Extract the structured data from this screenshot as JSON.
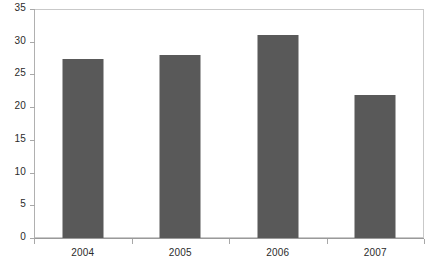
{
  "chart_data": {
    "type": "bar",
    "title": "",
    "xlabel": "",
    "ylabel": "",
    "categories": [
      "2004",
      "2005",
      "2006",
      "2007"
    ],
    "values": [
      27.3,
      28.0,
      31.0,
      21.8
    ],
    "series": [
      {
        "name": "",
        "values": [
          27.3,
          28.0,
          31.0,
          21.8
        ]
      }
    ],
    "ylim": [
      0,
      35
    ],
    "ytick_step": 5,
    "ytick_labels": [
      "0",
      "5",
      "10",
      "15",
      "20",
      "25",
      "30",
      "35"
    ],
    "ytick_values": [
      0,
      5,
      10,
      15,
      20,
      25,
      30,
      35
    ],
    "grid": false,
    "legend": false,
    "legend_position": "none",
    "bar_color": "#595959",
    "frame_color": "#c9c9c9",
    "axis_color": "#9a9a9a",
    "text_color": "#2b2b2b",
    "background": "#ffffff"
  }
}
